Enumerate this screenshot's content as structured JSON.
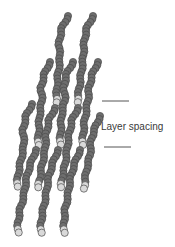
{
  "diagram": {
    "annotation": {
      "label": "Layer spacing",
      "top_line": {
        "x1": 102,
        "y1": 101,
        "x2": 129,
        "y2": 101
      },
      "bottom_line": {
        "x1": 104,
        "y1": 147,
        "x2": 131,
        "y2": 147
      },
      "text_x": 101,
      "text_y": 130
    },
    "colors": {
      "bead_fill": "#6e6e6e",
      "bead_stroke": "#4a4a4a",
      "bead_end_fill": "#d9d9d9",
      "line": "#555555",
      "text": "#3a3a3a"
    },
    "bead_radius": 3.6,
    "bead_spacing": 3.4,
    "chains": [
      {
        "id": "tier0-a",
        "points": [
          [
            68,
            16
          ],
          [
            61,
            30
          ],
          [
            59,
            45
          ],
          [
            60,
            60
          ],
          [
            58,
            75
          ],
          [
            57,
            90
          ],
          [
            56,
            104
          ]
        ]
      },
      {
        "id": "tier0-b",
        "points": [
          [
            93,
            16
          ],
          [
            86,
            30
          ],
          [
            84,
            45
          ],
          [
            83,
            60
          ],
          [
            81,
            75
          ],
          [
            79,
            90
          ],
          [
            77,
            104
          ]
        ]
      },
      {
        "id": "tier1-a",
        "points": [
          [
            50,
            62
          ],
          [
            44,
            75
          ],
          [
            41,
            88
          ],
          [
            42,
            100
          ],
          [
            40,
            112
          ],
          [
            39,
            125
          ],
          [
            38,
            148
          ]
        ]
      },
      {
        "id": "tier1-b",
        "points": [
          [
            73,
            62
          ],
          [
            66,
            75
          ],
          [
            64,
            88
          ],
          [
            65,
            100
          ],
          [
            62,
            112
          ],
          [
            61,
            125
          ],
          [
            60,
            148
          ]
        ]
      },
      {
        "id": "tier1-c",
        "points": [
          [
            98,
            62
          ],
          [
            92,
            75
          ],
          [
            89,
            88
          ],
          [
            88,
            100
          ],
          [
            86,
            112
          ],
          [
            84,
            125
          ],
          [
            82,
            148
          ]
        ]
      },
      {
        "id": "tier2-a",
        "points": [
          [
            32,
            104
          ],
          [
            26,
            116
          ],
          [
            23,
            130
          ],
          [
            24,
            145
          ],
          [
            21,
            160
          ],
          [
            18,
            175
          ],
          [
            17,
            188
          ]
        ]
      },
      {
        "id": "tier2-b",
        "points": [
          [
            55,
            108
          ],
          [
            49,
            120
          ],
          [
            46,
            135
          ],
          [
            45,
            150
          ],
          [
            42,
            165
          ],
          [
            40,
            178
          ],
          [
            38,
            190
          ]
        ]
      },
      {
        "id": "tier2-c",
        "points": [
          [
            78,
            108
          ],
          [
            72,
            120
          ],
          [
            69,
            135
          ],
          [
            67,
            150
          ],
          [
            65,
            165
          ],
          [
            62,
            178
          ],
          [
            61,
            190
          ]
        ]
      },
      {
        "id": "tier2-d",
        "points": [
          [
            100,
            116
          ],
          [
            95,
            128
          ],
          [
            91,
            140
          ],
          [
            90,
            155
          ],
          [
            87,
            168
          ],
          [
            85,
            180
          ],
          [
            84,
            190
          ]
        ]
      },
      {
        "id": "tier3-a",
        "points": [
          [
            36,
            150
          ],
          [
            30,
            165
          ],
          [
            26,
            180
          ],
          [
            24,
            195
          ],
          [
            20,
            210
          ],
          [
            18,
            222
          ],
          [
            18,
            235
          ]
        ]
      },
      {
        "id": "tier3-b",
        "points": [
          [
            58,
            150
          ],
          [
            52,
            165
          ],
          [
            48,
            180
          ],
          [
            46,
            195
          ],
          [
            43,
            210
          ],
          [
            41,
            222
          ],
          [
            41,
            235
          ]
        ]
      },
      {
        "id": "tier3-c",
        "points": [
          [
            80,
            150
          ],
          [
            74,
            165
          ],
          [
            70,
            180
          ],
          [
            68,
            195
          ],
          [
            65,
            210
          ],
          [
            64,
            222
          ],
          [
            64,
            235
          ]
        ]
      }
    ]
  }
}
